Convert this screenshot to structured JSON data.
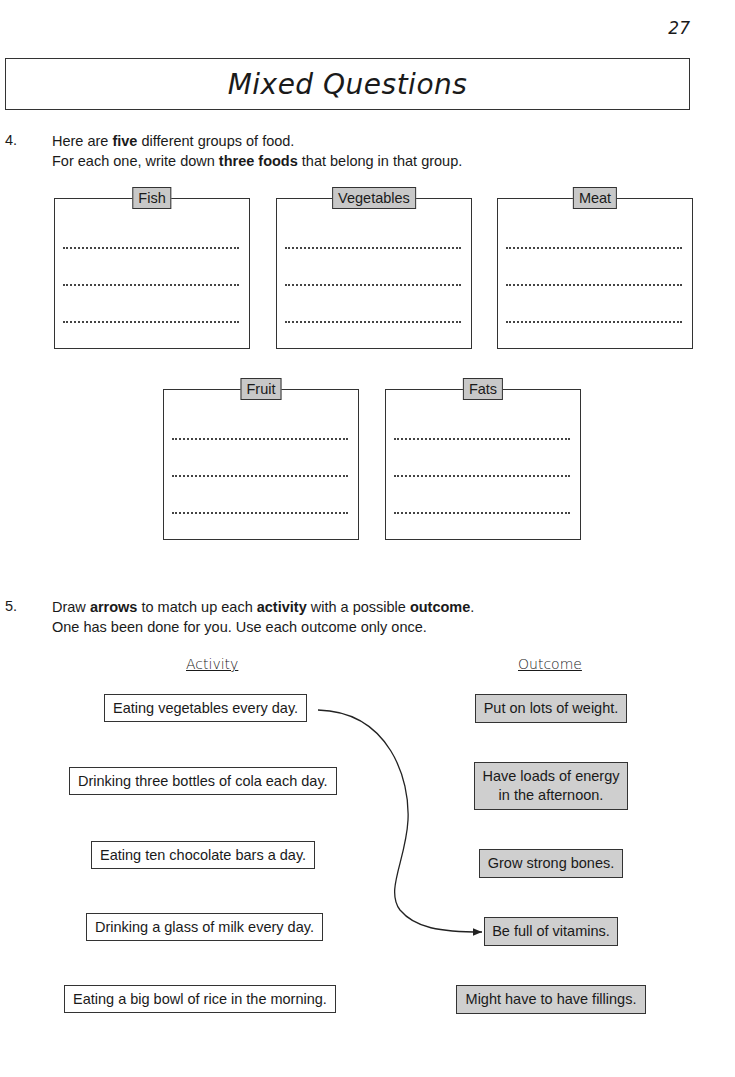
{
  "page_number": "27",
  "title": "Mixed Questions",
  "question4": {
    "number": "4.",
    "line1_pre": "Here are ",
    "line1_bold": "five",
    "line1_post": " different groups of food.",
    "line2_pre": "For each one, write down ",
    "line2_bold": "three foods",
    "line2_post": " that belong in that group.",
    "groups": [
      {
        "label": "Fish"
      },
      {
        "label": "Vegetables"
      },
      {
        "label": "Meat"
      },
      {
        "label": "Fruit"
      },
      {
        "label": "Fats"
      }
    ]
  },
  "question5": {
    "number": "5.",
    "line1_a": "Draw ",
    "line1_b": "arrows",
    "line1_c": " to match up each ",
    "line1_d": "activity",
    "line1_e": " with a possible ",
    "line1_f": "outcome",
    "line1_g": ".",
    "line2": "One has been done for you.  Use each outcome only once.",
    "activity_heading": "Activity",
    "outcome_heading": "Outcome",
    "activities": [
      "Eating vegetables every day.",
      "Drinking three bottles of cola each day.",
      "Eating ten chocolate bars a day.",
      "Drinking a glass of milk every day.",
      "Eating a big bowl of rice in the morning."
    ],
    "outcomes": [
      {
        "line1": "Put on lots of weight.",
        "line2": ""
      },
      {
        "line1": "Have loads of energy",
        "line2": "in the afternoon."
      },
      {
        "line1": "Grow strong bones.",
        "line2": ""
      },
      {
        "line1": "Be full of vitamins.",
        "line2": ""
      },
      {
        "line1": "Might have to have fillings.",
        "line2": ""
      }
    ],
    "example_match": {
      "activity": "Eating vegetables every day.",
      "outcome": "Be full of vitamins."
    }
  }
}
